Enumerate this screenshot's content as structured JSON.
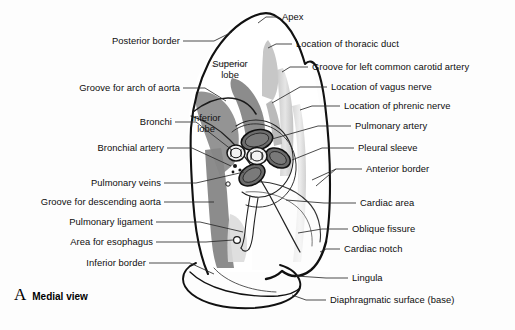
{
  "figure": {
    "panel_letter": "A",
    "panel_title": "Medial view"
  },
  "inner_labels": [
    {
      "id": "superior-lobe",
      "line1": "Superior",
      "line2": "lobe",
      "x": 228,
      "y": 58
    },
    {
      "id": "inferior-lobe",
      "line1": "Inferior",
      "line2": "lobe",
      "x": 205,
      "y": 112
    }
  ],
  "labels_left": [
    {
      "id": "posterior-border",
      "text": "Posterior border",
      "x": 179,
      "y": 41
    },
    {
      "id": "groove-arch-aorta",
      "text": "Groove for arch of aorta",
      "x": 179,
      "y": 88
    },
    {
      "id": "bronchi",
      "text": "Bronchi",
      "x": 171,
      "y": 122
    },
    {
      "id": "bronchial-artery",
      "text": "Bronchial artery",
      "x": 163,
      "y": 148
    },
    {
      "id": "pulmonary-veins",
      "text": "Pulmonary veins",
      "x": 160,
      "y": 183
    },
    {
      "id": "groove-descending-aorta",
      "text": "Groove for descending aorta",
      "x": 160,
      "y": 202
    },
    {
      "id": "pulmonary-ligament",
      "text": "Pulmonary ligament",
      "x": 152,
      "y": 222
    },
    {
      "id": "area-for-esophagus",
      "text": "Area for esophagus",
      "x": 152,
      "y": 242
    },
    {
      "id": "inferior-border",
      "text": "Inferior border",
      "x": 145,
      "y": 263
    }
  ],
  "labels_right": [
    {
      "id": "apex",
      "text": "Apex",
      "x": 282,
      "y": 17
    },
    {
      "id": "thoracic-duct",
      "text": "Location of thoracic duct",
      "x": 296,
      "y": 44
    },
    {
      "id": "carotid-groove",
      "text": "Groove for left common carotid artery",
      "x": 312,
      "y": 67
    },
    {
      "id": "vagus-nerve",
      "text": "Location of vagus nerve",
      "x": 331,
      "y": 87
    },
    {
      "id": "phrenic-nerve",
      "text": "Location of phrenic nerve",
      "x": 344,
      "y": 106
    },
    {
      "id": "pulmonary-artery",
      "text": "Pulmonary artery",
      "x": 355,
      "y": 126
    },
    {
      "id": "pleural-sleeve",
      "text": "Pleural sleeve",
      "x": 358,
      "y": 148
    },
    {
      "id": "anterior-border",
      "text": "Anterior border",
      "x": 366,
      "y": 169
    },
    {
      "id": "cardiac-area",
      "text": "Cardiac area",
      "x": 360,
      "y": 203
    },
    {
      "id": "oblique-fissure",
      "text": "Oblique fissure",
      "x": 352,
      "y": 229
    },
    {
      "id": "cardiac-notch",
      "text": "Cardiac notch",
      "x": 344,
      "y": 249
    },
    {
      "id": "lingula",
      "text": "Lingula",
      "x": 352,
      "y": 278
    },
    {
      "id": "diaphragmatic-surface",
      "text": "Diaphragmatic surface (base)",
      "x": 330,
      "y": 300
    }
  ],
  "colors": {
    "outline": "#111111",
    "leader": "#333333",
    "groove_dark": "#8a8a8a",
    "groove_mid": "#b4b4b4",
    "groove_light": "#d8d8d8",
    "vessel_fill": "#6f6f6f",
    "background": "#fdfdfd",
    "text": "#0d0d0d"
  }
}
